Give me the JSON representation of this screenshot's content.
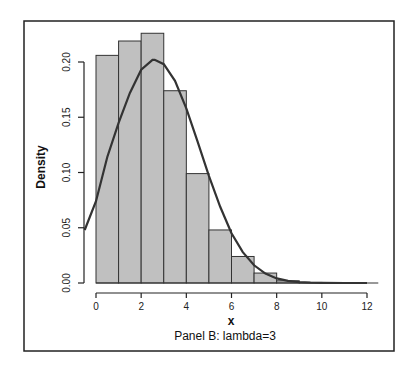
{
  "chart_data": {
    "type": "bar",
    "subtype": "histogram_with_density_curve",
    "title": "",
    "caption": "Panel B: lambda=3",
    "xlabel": "x",
    "ylabel": "Density",
    "xlim": [
      -0.5,
      12.5
    ],
    "ylim": [
      0,
      0.226
    ],
    "x_ticks": [
      0,
      2,
      4,
      6,
      8,
      10,
      12
    ],
    "y_ticks": [
      0.0,
      0.05,
      0.1,
      0.15,
      0.2
    ],
    "y_tick_labels": [
      "0.00",
      "0.05",
      "0.10",
      "0.15",
      "0.20"
    ],
    "grid": false,
    "legend": null,
    "bins": [
      {
        "start": 0,
        "end": 1,
        "density": 0.206
      },
      {
        "start": 1,
        "end": 2,
        "density": 0.219
      },
      {
        "start": 2,
        "end": 3,
        "density": 0.226
      },
      {
        "start": 3,
        "end": 4,
        "density": 0.174
      },
      {
        "start": 4,
        "end": 5,
        "density": 0.099
      },
      {
        "start": 5,
        "end": 6,
        "density": 0.048
      },
      {
        "start": 6,
        "end": 7,
        "density": 0.024
      },
      {
        "start": 7,
        "end": 8,
        "density": 0.009
      },
      {
        "start": 8,
        "end": 9,
        "density": 0.002
      },
      {
        "start": 9,
        "end": 10,
        "density": 0.0005
      },
      {
        "start": 10,
        "end": 11,
        "density": 0.0
      },
      {
        "start": 11,
        "end": 12,
        "density": 0.0
      },
      {
        "start": 12,
        "end": 12.5,
        "density": 0.0
      }
    ],
    "categories": [
      "0-1",
      "1-2",
      "2-3",
      "3-4",
      "4-5",
      "5-6",
      "6-7",
      "7-8",
      "8-9",
      "9-10",
      "10-11",
      "11-12",
      "12-12.5"
    ],
    "values": [
      0.206,
      0.219,
      0.226,
      0.174,
      0.099,
      0.048,
      0.024,
      0.009,
      0.002,
      0.0005,
      0,
      0,
      0
    ],
    "curve": {
      "name": "normal density (mean=2.6, sd≈1.97)",
      "x": [
        -0.5,
        0,
        0.5,
        1,
        1.5,
        2,
        2.5,
        2.6,
        3,
        3.5,
        4,
        4.5,
        5,
        5.5,
        6,
        6.5,
        7,
        7.5,
        8,
        8.5,
        9,
        9.5,
        10,
        11,
        12
      ],
      "y": [
        0.048,
        0.074,
        0.114,
        0.145,
        0.172,
        0.193,
        0.202,
        0.202,
        0.198,
        0.183,
        0.158,
        0.128,
        0.097,
        0.069,
        0.045,
        0.028,
        0.016,
        0.0085,
        0.0042,
        0.0019,
        0.0008,
        0.0003,
        0.0001,
        0,
        0
      ]
    },
    "colors": {
      "bar_fill": "#c0c0c0",
      "bar_stroke": "#333333",
      "curve": "#333333",
      "frame": "#222222"
    }
  }
}
